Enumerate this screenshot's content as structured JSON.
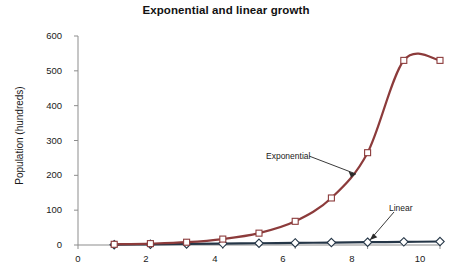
{
  "chart_data": {
    "type": "line",
    "title": "Exponential and linear growth",
    "xlabel": "",
    "ylabel": "Population (hundreds)",
    "xlim": [
      0,
      10
    ],
    "ylim": [
      0,
      600
    ],
    "grid": false,
    "legend_position": "none",
    "x": [
      1,
      2,
      3,
      4,
      5,
      6,
      7,
      8,
      9,
      10
    ],
    "xticks": [
      0,
      2,
      4,
      6,
      8,
      10
    ],
    "xtick_labels": [
      "0",
      "2",
      "4",
      "6",
      "8",
      "10"
    ],
    "yticks": [
      0,
      100,
      200,
      300,
      400,
      500,
      600
    ],
    "ytick_labels": [
      "0",
      "100",
      "200",
      "300",
      "400",
      "500",
      "600"
    ],
    "series": [
      {
        "name": "Exponential",
        "color": "#8c3b3b",
        "marker": "square",
        "values": [
          2,
          4,
          8,
          17,
          34,
          68,
          135,
          265,
          530,
          530
        ]
      },
      {
        "name": "Linear",
        "color": "#253647",
        "marker": "diamond",
        "values": [
          1,
          2,
          3,
          4,
          5,
          6,
          7,
          8,
          9,
          10
        ]
      }
    ],
    "annotations": [
      {
        "text": "Exponential",
        "target_series": "Exponential"
      },
      {
        "text": "Linear",
        "target_series": "Linear"
      }
    ]
  },
  "axis": {
    "y_title": "Population (hundreds)",
    "y_labels": [
      "600",
      "500",
      "400",
      "300",
      "200",
      "100",
      "0"
    ],
    "x_labels": [
      "0",
      "2",
      "4",
      "6",
      "8",
      "10"
    ]
  },
  "header": {
    "title": "Exponential and linear growth"
  },
  "annotations": {
    "exponential_label": "Exponential",
    "linear_label": "Linear"
  },
  "colors": {
    "exponential": "#8c3b3b",
    "linear": "#253647",
    "axis": "#8d8d8d",
    "text": "#1a1a1a"
  }
}
